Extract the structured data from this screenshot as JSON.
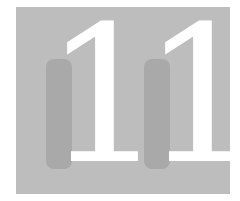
{
  "chapter": {
    "number": "11",
    "digits": [
      "1",
      "1"
    ]
  },
  "colors": {
    "background": "#bdbdbd",
    "shadow": "#a9a9a9",
    "numeral": "#ffffff"
  }
}
